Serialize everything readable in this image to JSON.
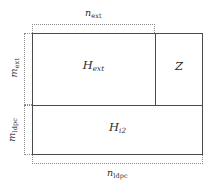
{
  "figure": {
    "type": "block-matrix-diagram",
    "colors": {
      "box_stroke": "#4a4a4a",
      "brace_stroke": "#8a8a8a",
      "text": "#2b2b2b",
      "background": "#ffffff"
    }
  },
  "blocks": [
    {
      "id": "h-ext",
      "base": "H",
      "subscript": "ext",
      "region": "upper-left"
    },
    {
      "id": "z",
      "base": "Z",
      "subscript": "",
      "region": "upper-right"
    },
    {
      "id": "h-i2",
      "base": "H",
      "subscript": "i2",
      "region": "lower-full"
    }
  ],
  "dimensions": [
    {
      "id": "n-ext",
      "base": "n",
      "subscript": "ext",
      "orientation": "horizontal",
      "position": "top",
      "spans": "h-ext"
    },
    {
      "id": "m-ext",
      "base": "m",
      "subscript": "ext",
      "orientation": "vertical",
      "position": "left-upper",
      "spans": "h-ext"
    },
    {
      "id": "m-ldpc",
      "base": "m",
      "subscript": "ldpc",
      "orientation": "vertical",
      "position": "left-lower",
      "spans": "h-i2"
    },
    {
      "id": "n-ldpc",
      "base": "n",
      "subscript": "ldpc",
      "orientation": "horizontal",
      "position": "bottom",
      "spans": "full-width"
    }
  ]
}
